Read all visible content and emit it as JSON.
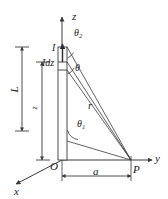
{
  "figure": {
    "background_color": "#ffffff",
    "line_color": "#3a3a3a",
    "text_color": "#1a1a1a",
    "wire_fill_color": "#fdfdfd"
  },
  "axes": {
    "z_label": "z",
    "y_label": "y",
    "x_label": "x",
    "origin_label": "O"
  },
  "points": {
    "field_point_label": "P"
  },
  "labels": {
    "current": "I",
    "current_element": "Idz",
    "length": "L",
    "height": "z",
    "distance_a": "a",
    "distance_r": "r",
    "theta": "θ",
    "theta_1": "θ",
    "theta_1_sub": "1",
    "theta_2": "θ",
    "theta_2_sub": "2"
  },
  "geometry": {
    "origin_x": 62,
    "origin_y": 160,
    "point_p_x": 131,
    "point_p_y": 160,
    "wire_top_y": 47,
    "wire_bottom_y": 160,
    "wire_left_x": 58,
    "wire_right_x": 67,
    "element_top_y": 62,
    "element_bottom_y": 70,
    "dim_L_x": 22,
    "dim_L_top_y": 47,
    "dim_L_bottom_y": 131,
    "dim_z_x": 42,
    "dim_z_top_y": 62,
    "dim_z_bottom_y": 160,
    "dim_a_y": 176
  }
}
